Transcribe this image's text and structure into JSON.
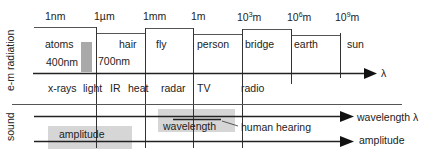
{
  "diagram": {
    "em_section": {
      "side_label": "e-m radiation",
      "scale_ticks": [
        {
          "label": "1nm"
        },
        {
          "label": "1µm"
        },
        {
          "label": "1mm"
        },
        {
          "label": "1m"
        },
        {
          "base": "10",
          "exp": "3",
          "unit": "m"
        },
        {
          "base": "10",
          "exp": "6",
          "unit": "m"
        },
        {
          "base": "10",
          "exp": "9",
          "unit": "m"
        }
      ],
      "objects": [
        "atoms",
        "hair",
        "fly",
        "person",
        "bridge",
        "earth",
        "sun"
      ],
      "visible_band": {
        "start_label": "400nm",
        "end_label": "700nm",
        "color": "#a9a9a9"
      },
      "axis_label": "λ",
      "radiation_types": [
        "x-rays",
        "light",
        "IR",
        "heat",
        "radar",
        "TV",
        "radio"
      ]
    },
    "sound_section": {
      "side_label": "sound",
      "wavelength_axis_label": "wavelength λ",
      "amplitude_axis_label": "amplitude",
      "amplitude_box_label": "amplitude",
      "wavelength_box_label": "wavelength",
      "hearing_label": "human hearing",
      "box_color": "#d6d6d6"
    }
  }
}
